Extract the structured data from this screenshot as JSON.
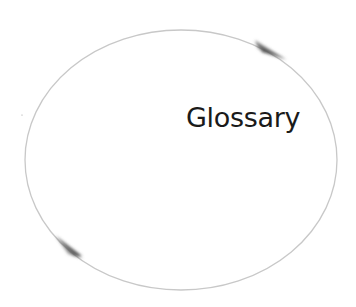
{
  "diagram": {
    "type": "cycle",
    "label": "Glossary",
    "ellipse": {
      "cx": 181,
      "cy": 160,
      "rx": 156,
      "ry": 130,
      "stroke": "#c8c8c8"
    },
    "arrows": [
      {
        "name": "top-right-arrow",
        "direction": "clockwise",
        "color": "#555555"
      },
      {
        "name": "bottom-left-arrow",
        "direction": "clockwise",
        "color": "#555555"
      }
    ]
  }
}
